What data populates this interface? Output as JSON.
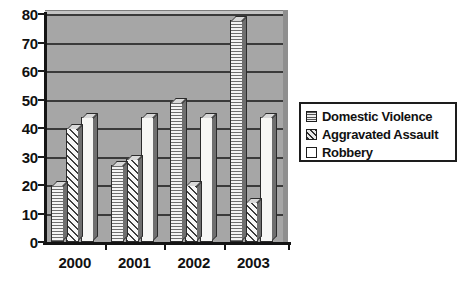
{
  "chart_data": {
    "type": "bar",
    "title": "",
    "xlabel": "",
    "ylabel": "",
    "categories": [
      "2000",
      "2001",
      "2002",
      "2003"
    ],
    "series": [
      {
        "name": "Domestic Violence",
        "fill": "horizontal-lines",
        "values": [
          20,
          27,
          49,
          78
        ]
      },
      {
        "name": "Aggravated Assault",
        "fill": "diagonal-hatch",
        "values": [
          40,
          29,
          20,
          14
        ]
      },
      {
        "name": "Robbery",
        "fill": "solid-white",
        "values": [
          44,
          44,
          44,
          44
        ]
      }
    ],
    "ylim": [
      0,
      80
    ],
    "ytick_labels": [
      "0",
      "10",
      "20",
      "30",
      "40",
      "50",
      "60",
      "70",
      "80"
    ],
    "ytick_values": [
      0,
      10,
      20,
      30,
      40,
      50,
      60,
      70,
      80
    ],
    "grid": true,
    "grid_axis": "y",
    "legend_position": "right",
    "plot_background": "#a6a6a6",
    "figure_background": "#ffffff",
    "bar_style": "3d-column",
    "axis_color": "#141414",
    "gridline_color": "#3a3a3a"
  },
  "legend": {
    "entries": [
      {
        "label": "Domestic Violence",
        "swatch": "hlines-swatch"
      },
      {
        "label": "Aggravated Assault",
        "swatch": "diagonal-swatch"
      },
      {
        "label": "Robbery",
        "swatch": "solid-swatch"
      }
    ]
  }
}
